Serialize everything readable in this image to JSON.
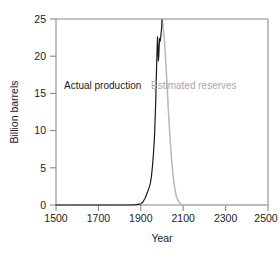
{
  "chart_data": {
    "type": "line",
    "title": "",
    "xlabel": "Year",
    "ylabel": "Billion barrels",
    "xlim": [
      1500,
      2500
    ],
    "ylim": [
      0,
      25
    ],
    "xticks": [
      1500,
      1700,
      1900,
      2100,
      2300,
      2500
    ],
    "yticks": [
      0,
      5,
      10,
      15,
      20,
      25
    ],
    "grid": false,
    "legend_position": "inline-annotations",
    "annotations": [
      {
        "name": "actual-production-label",
        "text": "Actual production",
        "color": "#1a1a1a",
        "x": 1720,
        "y": 15.6
      },
      {
        "name": "estimated-reserves-label",
        "text": "Estimated reserves",
        "color": "#a8a8a8",
        "x": 2150,
        "y": 15.6
      }
    ],
    "series": [
      {
        "name": "Actual production",
        "color": "#1a1a1a",
        "x": [
          1500,
          1700,
          1850,
          1880,
          1900,
          1910,
          1920,
          1930,
          1940,
          1945,
          1950,
          1955,
          1960,
          1965,
          1970,
          1973,
          1975,
          1977,
          1979,
          1981,
          1983,
          1985,
          1987,
          1989,
          1991,
          1993,
          1995,
          1997,
          1999,
          2000
        ],
        "y": [
          0,
          0,
          0,
          0.05,
          0.15,
          0.4,
          0.9,
          1.6,
          2.4,
          2.9,
          3.8,
          5.2,
          7.0,
          9.4,
          13.5,
          17.0,
          19.2,
          21.0,
          22.6,
          21.2,
          19.4,
          20.2,
          21.6,
          22.4,
          22.0,
          22.3,
          22.9,
          23.4,
          24.2,
          24.9
        ]
      },
      {
        "name": "Estimated reserves",
        "color": "#b8b8b8",
        "x": [
          2000,
          2005,
          2010,
          2015,
          2020,
          2025,
          2030,
          2035,
          2040,
          2045,
          2050,
          2055,
          2060,
          2065,
          2070,
          2080,
          2090,
          2100,
          2200,
          2400,
          2500
        ],
        "y": [
          24.9,
          24.0,
          22.6,
          20.6,
          18.2,
          15.5,
          12.8,
          10.3,
          8.1,
          6.2,
          4.6,
          3.3,
          2.3,
          1.5,
          0.95,
          0.35,
          0.1,
          0.0,
          0.0,
          0.0,
          0.0
        ]
      }
    ],
    "peak": {
      "x": 2000,
      "y": 25
    }
  },
  "axes": {
    "y_label": "Billion barrels",
    "x_label": "Year",
    "x_tick_labels": [
      "1500",
      "1700",
      "1900",
      "2100",
      "2300",
      "2500"
    ],
    "y_tick_labels": [
      "0",
      "5",
      "10",
      "15",
      "20",
      "25"
    ]
  },
  "colors": {
    "production_line": "#1a1a1a",
    "reserves_line": "#b8b8b8",
    "axis": "#8a8a8a",
    "text": "#222222",
    "gray_text": "#a8a8a8",
    "background": "#ffffff"
  }
}
